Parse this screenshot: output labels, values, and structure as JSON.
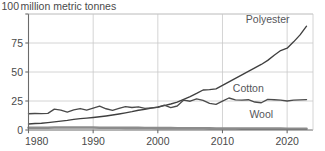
{
  "chart_data": {
    "type": "line",
    "subtitle": "",
    "xlabel": "",
    "ylabel": "million metric tonnes",
    "xlim": [
      1980,
      2024
    ],
    "ylim": [
      0,
      100
    ],
    "grid": true,
    "legend_position": "inline-right",
    "y_ticks": [
      "100",
      "75",
      "50",
      "25",
      "0"
    ],
    "y_tick_values": [
      100,
      75,
      50,
      25,
      0
    ],
    "x_ticks": [
      "1980",
      "1990",
      "2000",
      "2010",
      "2020"
    ],
    "x_tick_values": [
      1980,
      1990,
      2000,
      2010,
      2020
    ],
    "x": [
      1980,
      1981,
      1982,
      1983,
      1984,
      1985,
      1986,
      1987,
      1988,
      1989,
      1990,
      1991,
      1992,
      1993,
      1994,
      1995,
      1996,
      1997,
      1998,
      1999,
      2000,
      2001,
      2002,
      2003,
      2004,
      2005,
      2006,
      2007,
      2008,
      2009,
      2010,
      2011,
      2012,
      2013,
      2014,
      2015,
      2016,
      2017,
      2018,
      2019,
      2020,
      2021,
      2022,
      2023
    ],
    "series": [
      {
        "name": "Polyester",
        "color": "#3f3f3f",
        "values": [
          5.2,
          5.6,
          5.8,
          6.4,
          7.0,
          7.6,
          8.3,
          9.2,
          9.8,
          10.3,
          10.8,
          11.4,
          12.1,
          12.9,
          13.8,
          14.8,
          15.8,
          17.0,
          17.8,
          18.8,
          19.8,
          21.0,
          22.4,
          24.0,
          26.5,
          28.8,
          31.5,
          34.5,
          34.8,
          35.5,
          38.5,
          41.5,
          44.5,
          47.5,
          50.5,
          53.5,
          56.5,
          60.0,
          64.5,
          68.5,
          70.5,
          76.0,
          82.0,
          89.5
        ]
      },
      {
        "name": "Cotton",
        "color": "#4a4a4a",
        "values": [
          14.0,
          14.2,
          14.1,
          14.3,
          18.0,
          17.2,
          15.4,
          17.3,
          18.5,
          17.2,
          18.9,
          20.5,
          18.3,
          16.9,
          18.6,
          20.2,
          19.4,
          20.0,
          18.7,
          19.1,
          19.5,
          21.4,
          19.3,
          20.7,
          25.8,
          24.8,
          26.8,
          25.5,
          23.0,
          22.1,
          24.8,
          27.6,
          26.0,
          25.8,
          26.1,
          24.1,
          23.5,
          26.4,
          26.1,
          25.7,
          25.0,
          25.8,
          26.0,
          26.2
        ]
      },
      {
        "name": "Wool",
        "color": "#8c8c8c",
        "values": [
          2.0,
          2.0,
          2.0,
          2.0,
          2.1,
          2.1,
          2.1,
          2.1,
          2.1,
          2.1,
          2.1,
          2.0,
          2.0,
          1.9,
          1.9,
          1.8,
          1.8,
          1.8,
          1.7,
          1.7,
          1.6,
          1.6,
          1.6,
          1.5,
          1.5,
          1.5,
          1.5,
          1.5,
          1.4,
          1.3,
          1.3,
          1.3,
          1.3,
          1.2,
          1.2,
          1.2,
          1.2,
          1.2,
          1.2,
          1.2,
          1.1,
          1.1,
          1.1,
          1.1
        ]
      }
    ],
    "annotations": [
      {
        "text": "Polyester",
        "x": 2017,
        "y": 92
      },
      {
        "text": "Cotton",
        "x": 2014,
        "y": 33
      },
      {
        "text": "Wool",
        "x": 2016,
        "y": 10
      }
    ]
  }
}
